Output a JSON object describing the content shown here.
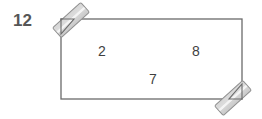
{
  "figure": {
    "type": "geometry-diagram",
    "shape": "rectangle",
    "background_color": "#ffffff",
    "stroke_color": "#6a6a6a",
    "labels": {
      "exterior_left": "12",
      "interior_top_left": "2",
      "interior_top_right": "8",
      "interior_bottom": "7"
    },
    "markers": {
      "top_left": "diagonal-hatch-bar",
      "bottom_right": "diagonal-hatch-bar",
      "fill_color": "#d8d8d8",
      "highlight_color": "#f2f2f2",
      "edge_color": "#8a8a8a"
    }
  }
}
